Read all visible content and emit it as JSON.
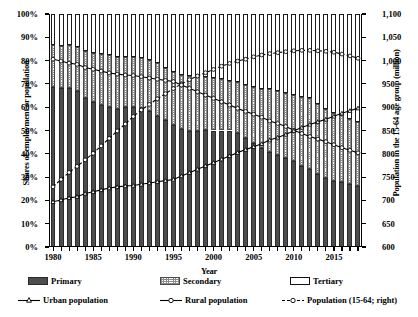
{
  "chart_data": {
    "type": "bar",
    "title": "",
    "xlabel": "Year",
    "ylabel": "Shares of employment or population",
    "ylabel_right": "Population in the 15-64 age group (million)",
    "ylim": [
      0,
      100
    ],
    "ylim_right": [
      600,
      1100
    ],
    "ytick_labels": [
      "100%",
      "90%",
      "80%",
      "70%",
      "60%",
      "50%",
      "40%",
      "30%",
      "20%",
      "10%",
      "0%"
    ],
    "ytick_values": [
      100,
      90,
      80,
      70,
      60,
      50,
      40,
      30,
      20,
      10,
      0
    ],
    "ytick_labels_right": [
      "1,100",
      "1,050",
      "1,000",
      "950",
      "900",
      "850",
      "800",
      "750",
      "700",
      "650",
      "600"
    ],
    "ytick_values_right": [
      1100,
      1050,
      1000,
      950,
      900,
      850,
      800,
      750,
      700,
      650,
      600
    ],
    "xtick_labels": [
      "1980",
      "1985",
      "1990",
      "1995",
      "2000",
      "2005",
      "2010",
      "2015"
    ],
    "xtick_values": [
      1980,
      1985,
      1990,
      1995,
      2000,
      2005,
      2010,
      2015
    ],
    "grid": false,
    "legend_position": "below",
    "categories": [
      1980,
      1981,
      1982,
      1983,
      1984,
      1985,
      1986,
      1987,
      1988,
      1989,
      1990,
      1991,
      1992,
      1993,
      1994,
      1995,
      1996,
      1997,
      1998,
      1999,
      2000,
      2001,
      2002,
      2003,
      2004,
      2005,
      2006,
      2007,
      2008,
      2009,
      2010,
      2011,
      2012,
      2013,
      2014,
      2015,
      2016,
      2017,
      2018
    ],
    "series": [
      {
        "name": "Primary",
        "type": "bar",
        "stack": "shares",
        "axis": "left",
        "values": [
          68.7,
          68.1,
          68.1,
          67.1,
          64.1,
          62.4,
          60.9,
          60.0,
          59.3,
          60.1,
          60.1,
          59.7,
          58.5,
          56.4,
          54.3,
          52.2,
          50.5,
          49.9,
          49.8,
          50.1,
          50.0,
          50.0,
          50.0,
          49.1,
          46.9,
          44.8,
          42.6,
          40.8,
          39.6,
          38.1,
          36.7,
          34.8,
          33.6,
          31.4,
          29.5,
          28.3,
          27.7,
          27.0,
          26.1
        ]
      },
      {
        "name": "Secondary",
        "type": "bar",
        "stack": "shares",
        "axis": "left",
        "values": [
          18.2,
          18.3,
          18.4,
          18.7,
          19.9,
          20.8,
          21.9,
          22.2,
          22.4,
          21.6,
          21.4,
          21.4,
          21.7,
          22.4,
          22.7,
          23.0,
          23.5,
          23.7,
          23.5,
          23.0,
          22.5,
          22.3,
          21.4,
          21.6,
          22.5,
          23.8,
          25.2,
          26.8,
          27.2,
          27.8,
          28.7,
          29.5,
          30.3,
          30.1,
          29.9,
          29.3,
          28.8,
          28.1,
          27.6
        ]
      },
      {
        "name": "Tertiary",
        "type": "bar",
        "stack": "shares",
        "axis": "left",
        "values": [
          13.1,
          13.6,
          13.5,
          14.2,
          16.0,
          16.8,
          17.2,
          17.8,
          18.3,
          18.3,
          18.5,
          18.9,
          19.8,
          21.2,
          23.0,
          24.8,
          26.0,
          26.4,
          26.7,
          26.9,
          27.5,
          27.7,
          28.6,
          29.3,
          30.6,
          31.4,
          32.2,
          32.4,
          33.2,
          34.1,
          34.6,
          35.7,
          36.1,
          38.5,
          40.6,
          42.4,
          43.5,
          44.9,
          46.3
        ]
      },
      {
        "name": "Urban population",
        "type": "line",
        "axis": "left",
        "values": [
          19.4,
          20.2,
          21.1,
          21.6,
          23.0,
          23.7,
          24.5,
          25.3,
          25.8,
          26.2,
          26.4,
          26.9,
          27.5,
          28.0,
          28.5,
          29.0,
          30.5,
          31.9,
          33.4,
          34.8,
          36.2,
          37.7,
          39.1,
          40.5,
          41.8,
          43.0,
          44.3,
          45.9,
          47.0,
          48.3,
          49.9,
          51.3,
          52.6,
          53.7,
          54.8,
          56.1,
          57.4,
          58.5,
          59.6
        ]
      },
      {
        "name": "Rural population",
        "type": "line",
        "axis": "left",
        "values": [
          80.6,
          79.8,
          78.9,
          78.4,
          77.0,
          76.3,
          75.5,
          74.7,
          74.2,
          73.8,
          73.6,
          73.1,
          72.5,
          72.0,
          71.5,
          71.0,
          69.5,
          68.1,
          66.6,
          65.2,
          63.8,
          62.3,
          60.9,
          59.5,
          58.2,
          57.0,
          55.7,
          54.1,
          53.0,
          51.7,
          50.1,
          48.7,
          47.4,
          46.3,
          45.2,
          43.9,
          42.6,
          41.5,
          40.4
        ]
      },
      {
        "name": "Population (15-64; right)",
        "type": "line",
        "axis": "right",
        "values": [
          729,
          745,
          760,
          773,
          787,
          801,
          817,
          833,
          849,
          864,
          880,
          894,
          906,
          918,
          929,
          940,
          950,
          959,
          967,
          974,
          981,
          988,
          994,
          999,
          1003,
          1008,
          1012,
          1015,
          1017,
          1019,
          1021,
          1022,
          1022,
          1021,
          1020,
          1018,
          1014,
          1010,
          1005
        ]
      }
    ],
    "legend": [
      {
        "label": "Primary",
        "kind": "swatch-primary"
      },
      {
        "label": "Secondary",
        "kind": "swatch-secondary"
      },
      {
        "label": "Tertiary",
        "kind": "swatch-tertiary"
      },
      {
        "label": "Urban population",
        "kind": "line-triangle"
      },
      {
        "label": "Rural population",
        "kind": "line-circle"
      },
      {
        "label": "Population (15-64; right)",
        "kind": "line-dashed-circle"
      }
    ]
  },
  "colors": {
    "primary_fill": "#4d4d4d",
    "secondary_fill": "#ffffff",
    "tertiary_fill": "#ffffff",
    "line": "#000000",
    "axis": "#000000",
    "background": "#ffffff"
  }
}
